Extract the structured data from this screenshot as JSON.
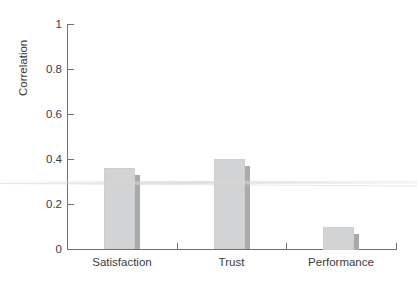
{
  "chart_data": {
    "type": "bar",
    "title": "",
    "subtitle": "",
    "xlabel": "",
    "ylabel": "Correlation",
    "categories": [
      "Satisfaction",
      "Trust",
      "Performance"
    ],
    "values": [
      0.36,
      0.4,
      0.1
    ],
    "series": [
      {
        "name": "Correlation",
        "values": [
          0.36,
          0.4,
          0.1
        ]
      }
    ],
    "ylim": [
      0,
      1
    ],
    "xlim_categories": 3,
    "y_ticks": [
      "0",
      "0.2",
      "0.4",
      "0.6",
      "0.8",
      "1"
    ],
    "y_tick_values": [
      0,
      0.2,
      0.4,
      0.6,
      0.8,
      1
    ],
    "grid": false,
    "legend": false,
    "legend_position": "none",
    "annotations": [],
    "colors": {
      "bar_face": "#d2d3d4",
      "bar_shadow": "#a9aaac",
      "axis": "#6f7072",
      "text": "#3b3b3d",
      "background": "#ffffff"
    }
  },
  "axis": {
    "y_label": "Correlation",
    "y_ticks": [
      {
        "label": "1",
        "value": 1
      },
      {
        "label": "0.8",
        "value": 0.8
      },
      {
        "label": "0.6",
        "value": 0.6
      },
      {
        "label": "0.4",
        "value": 0.4
      },
      {
        "label": "0.2",
        "value": 0.2
      },
      {
        "label": "0",
        "value": 0
      }
    ],
    "x_ticks": [
      {
        "label": "Satisfaction"
      },
      {
        "label": "Trust"
      },
      {
        "label": "Performance"
      }
    ]
  }
}
